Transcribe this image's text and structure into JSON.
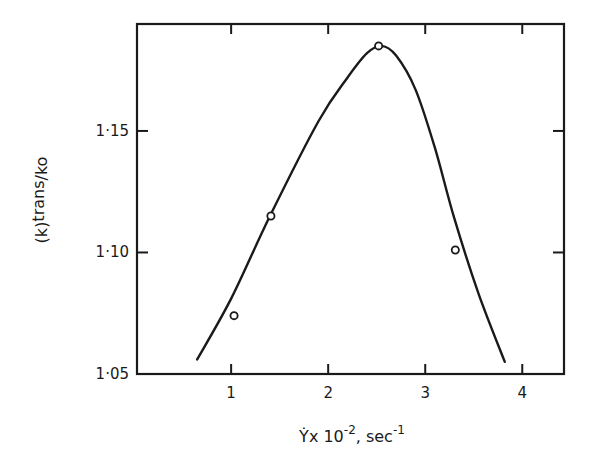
{
  "chart_data": {
    "type": "scatter",
    "title": "",
    "xlabel": "γ̇ x 10⁻², sec⁻¹",
    "xlabel_parts": {
      "main": "Ẏx 10",
      "exp1": "-2",
      "mid": ", sec",
      "exp2": "-1"
    },
    "ylabel": "(k)trans/ko",
    "ylabel_parts": {
      "pre": "(k)",
      "sub": "trans",
      "post": "/ko"
    },
    "xlim": [
      0.03,
      4.43
    ],
    "ylim": [
      1.05,
      1.194
    ],
    "x_ticks": [
      1,
      2,
      3,
      4
    ],
    "x_tick_labels": [
      "1",
      "2",
      "3",
      "4"
    ],
    "y_ticks": [
      1.05,
      1.1,
      1.15
    ],
    "y_tick_labels": [
      "1·05",
      "1·10",
      "1·15"
    ],
    "grid": false,
    "legend": null,
    "series": [
      {
        "name": "measured",
        "kind": "points",
        "marker": "open-circle",
        "x": [
          1.03,
          1.41,
          2.52,
          3.31
        ],
        "y": [
          1.074,
          1.115,
          1.185,
          1.101
        ]
      },
      {
        "name": "fitted curve",
        "kind": "line",
        "x": [
          0.65,
          1.0,
          1.4,
          1.9,
          2.2,
          2.4,
          2.55,
          2.7,
          2.9,
          3.1,
          3.3,
          3.55,
          3.82
        ],
        "y": [
          1.056,
          1.081,
          1.115,
          1.154,
          1.172,
          1.182,
          1.185,
          1.181,
          1.167,
          1.143,
          1.114,
          1.083,
          1.055
        ]
      }
    ]
  }
}
